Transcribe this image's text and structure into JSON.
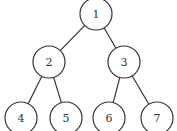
{
  "diagram": {
    "type": "binary-tree",
    "nodes": [
      {
        "id": "1",
        "label": "1",
        "cx": 96,
        "cy": 14,
        "r": 16
      },
      {
        "id": "2",
        "label": "2",
        "cx": 49,
        "cy": 62,
        "r": 16
      },
      {
        "id": "3",
        "label": "3",
        "cx": 124,
        "cy": 62,
        "r": 16
      },
      {
        "id": "4",
        "label": "4",
        "cx": 21,
        "cy": 118,
        "r": 16
      },
      {
        "id": "5",
        "label": "5",
        "cx": 66,
        "cy": 118,
        "r": 16
      },
      {
        "id": "6",
        "label": "6",
        "cx": 109,
        "cy": 118,
        "r": 16
      },
      {
        "id": "7",
        "label": "7",
        "cx": 157,
        "cy": 118,
        "r": 16
      }
    ],
    "edges": [
      {
        "from": "1",
        "to": "2"
      },
      {
        "from": "1",
        "to": "3"
      },
      {
        "from": "2",
        "to": "4"
      },
      {
        "from": "2",
        "to": "5"
      },
      {
        "from": "3",
        "to": "6"
      },
      {
        "from": "3",
        "to": "7"
      }
    ],
    "colors": {
      "stroke": "#333333",
      "fill": "#ffffff",
      "text": "#333333"
    }
  }
}
